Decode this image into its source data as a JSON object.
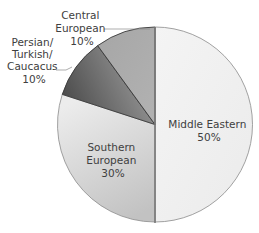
{
  "chart_data": {
    "type": "pie",
    "title": "",
    "categories": [
      "Middle Eastern",
      "Southern European",
      "Persian/Turkish/Caucacus",
      "Central European"
    ],
    "values": [
      50,
      30,
      10,
      10
    ],
    "unit": "%",
    "start_angle_deg": 0,
    "direction": "clockwise",
    "legend": "none (labels on/next to slices)",
    "slices": [
      {
        "label_lines": [
          "Middle Eastern",
          "50%"
        ],
        "value": 50,
        "color": "#f2f2f2",
        "color2": "#e9e9e9",
        "label_inside": true
      },
      {
        "label_lines": [
          "Southern",
          "European",
          "30%"
        ],
        "value": 30,
        "color": "#e6e6e6",
        "color2": "#c4c4c4",
        "label_inside": true
      },
      {
        "label_lines": [
          "Persian/",
          "Turkish/",
          "Caucacus",
          "10%"
        ],
        "value": 10,
        "color": "#4f4f4f",
        "color2": "#9a9a9a",
        "label_inside": false
      },
      {
        "label_lines": [
          "Central",
          "European",
          "10%"
        ],
        "value": 10,
        "color": "#a9a9a9",
        "color2": "#b4b4b4",
        "label_inside": false
      }
    ]
  },
  "style": {
    "outline_color": "#7a7a7a",
    "separator_color": "#3a3a3a",
    "label_color": "#404040"
  }
}
